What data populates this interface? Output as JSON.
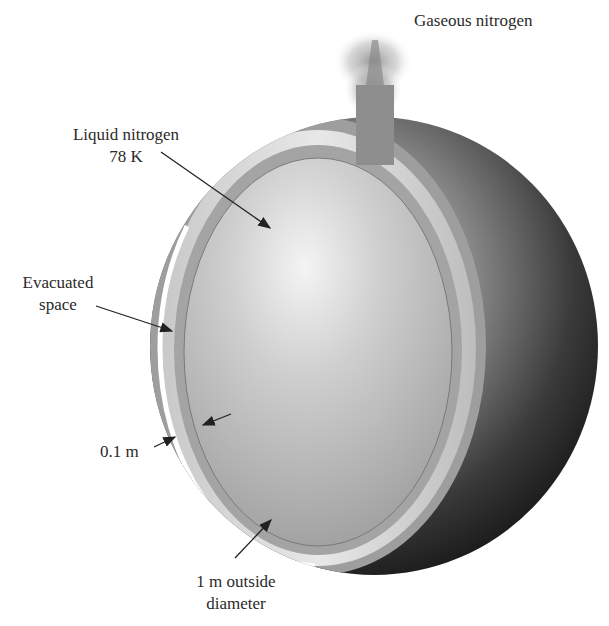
{
  "figure": {
    "labels": {
      "gas": "Gaseous nitrogen",
      "liquid_line1": "Liquid nitrogen",
      "liquid_line2": "78 K",
      "evac_line1": "Evacuated",
      "evac_line2": "space",
      "thickness": "0.1 m",
      "diameter_line1": "1 m outside",
      "diameter_line2": "diameter"
    },
    "colors": {
      "background": "#ffffff",
      "text": "#2a2a2a",
      "shell_gray": "#9a9a9a",
      "sphere_dark": "#1e1e1e",
      "liquid_gray": "#b8b8b8",
      "arrow": "#222222"
    }
  }
}
